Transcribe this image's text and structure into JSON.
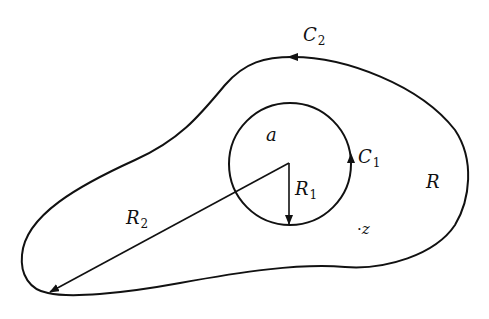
{
  "diagram": {
    "type": "complex-analysis-annulus-region",
    "labels": {
      "outer_contour": {
        "base": "C",
        "sub": "2"
      },
      "inner_contour": {
        "base": "C",
        "sub": "1"
      },
      "center_point": "a",
      "inner_radius": {
        "base": "R",
        "sub": "1"
      },
      "outer_radius": {
        "base": "R",
        "sub": "2"
      },
      "region": "R",
      "point": "z",
      "point_marker": "·"
    },
    "colors": {
      "stroke": "#111111",
      "background": "#ffffff"
    }
  }
}
